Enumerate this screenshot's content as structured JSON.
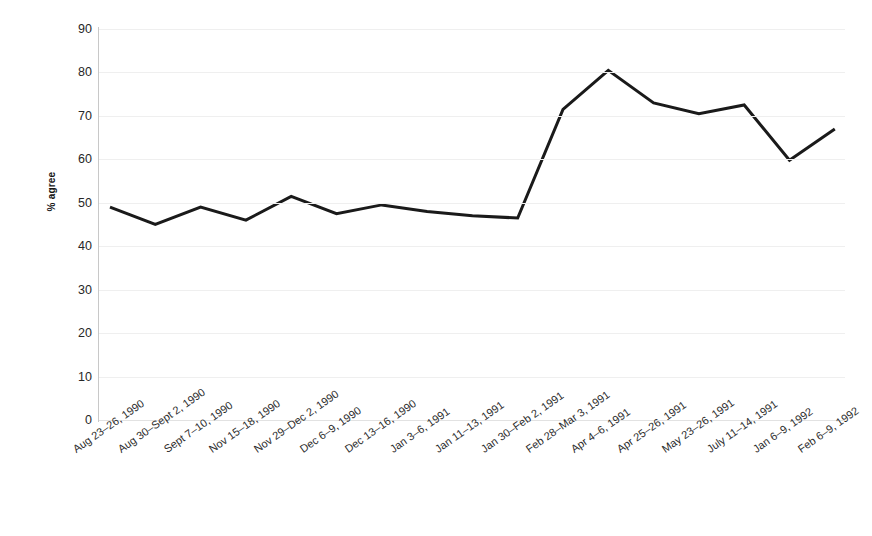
{
  "chart_data": {
    "type": "line",
    "title": "",
    "subtitle": "",
    "xlabel": "",
    "ylabel": "% agree",
    "ylim": [
      0,
      90
    ],
    "ytick_step": 10,
    "yticks": [
      90,
      80,
      70,
      60,
      50,
      40,
      30,
      20,
      10,
      0
    ],
    "grid": "horizontal",
    "legend": "none",
    "line_color": "#1a1a1a",
    "line_width": 3,
    "categories": [
      "Aug 23–26, 1990",
      "Aug 30–Sept 2, 1990",
      "Sept 7–10, 1990",
      "Nov 15–18, 1990",
      "Nov 29–Dec 2, 1990",
      "Dec 6–9, 1990",
      "Dec 13–16, 1990",
      "Jan 3–6, 1991",
      "Jan 11–13, 1991",
      "Jan 30–Feb 2, 1991",
      "Feb 28–Mar 3, 1991",
      "Apr 4–6, 1991",
      "Apr 25–26, 1991",
      "May 23–26, 1991",
      "July 11–14, 1991",
      "Jan 6–9, 1992",
      "Feb 6–9, 1992"
    ],
    "values": [
      49.0,
      45.0,
      49.0,
      46.0,
      51.5,
      47.5,
      49.5,
      48.0,
      47.0,
      46.5,
      71.5,
      80.5,
      73.0,
      70.5,
      72.5,
      59.8,
      67.0
    ],
    "series": [
      {
        "name": "% agree",
        "values": [
          49.0,
          45.0,
          49.0,
          46.0,
          51.5,
          47.5,
          49.5,
          48.0,
          47.0,
          46.5,
          71.5,
          80.5,
          73.0,
          70.5,
          72.5,
          59.8,
          67.0
        ]
      }
    ]
  }
}
